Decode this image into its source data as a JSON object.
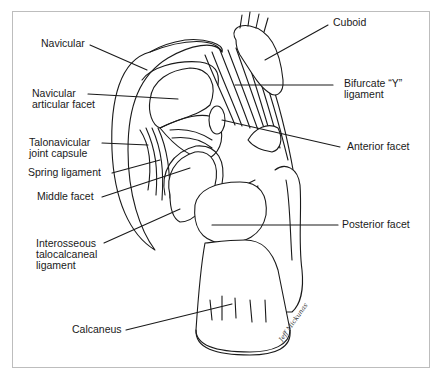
{
  "figure": {
    "signature": "Jeff Mickunas"
  },
  "labels": {
    "navicular": "Navicular",
    "navicular_articular_facet": "Navicular\narticular facet",
    "talonavicular_joint_capsule": "Talonavicular\njoint capsule",
    "spring_ligament": "Spring ligament",
    "middle_facet": "Middle facet",
    "interosseous_ligament": "Interosseous\ntalocalcaneal\nligament",
    "calcaneus": "Calcaneus",
    "cuboid": "Cuboid",
    "bifurcate_ligament": "Bifurcate “Y”\nligament",
    "anterior_facet": "Anterior facet",
    "posterior_facet": "Posterior facet"
  },
  "colors": {
    "ink": "#1a1a1a",
    "frame": "#bdbdbd",
    "background": "#ffffff"
  }
}
